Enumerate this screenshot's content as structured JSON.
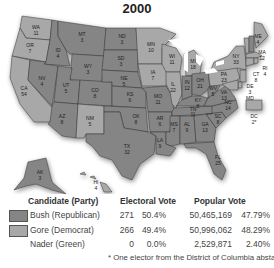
{
  "title": "2000",
  "colors": {
    "bush": "#858585",
    "gore": "#a8a8a8",
    "lake": "#ffffff",
    "text": "#333333"
  },
  "map": {
    "states": [
      {
        "abbr": "WA",
        "ev": "11",
        "winner": "gore"
      },
      {
        "abbr": "OR",
        "ev": "7",
        "winner": "gore"
      },
      {
        "abbr": "CA",
        "ev": "54",
        "winner": "gore"
      },
      {
        "abbr": "ID",
        "ev": "4",
        "winner": "bush"
      },
      {
        "abbr": "NV",
        "ev": "4",
        "winner": "bush"
      },
      {
        "abbr": "MT",
        "ev": "3",
        "winner": "bush"
      },
      {
        "abbr": "WY",
        "ev": "3",
        "winner": "bush"
      },
      {
        "abbr": "UT",
        "ev": "5",
        "winner": "bush"
      },
      {
        "abbr": "CO",
        "ev": "8",
        "winner": "bush"
      },
      {
        "abbr": "AZ",
        "ev": "8",
        "winner": "bush"
      },
      {
        "abbr": "NM",
        "ev": "5",
        "winner": "gore"
      },
      {
        "abbr": "ND",
        "ev": "3",
        "winner": "bush"
      },
      {
        "abbr": "SD",
        "ev": "3",
        "winner": "bush"
      },
      {
        "abbr": "NE",
        "ev": "5",
        "winner": "bush"
      },
      {
        "abbr": "KS",
        "ev": "6",
        "winner": "bush"
      },
      {
        "abbr": "OK",
        "ev": "8",
        "winner": "bush"
      },
      {
        "abbr": "TX",
        "ev": "32",
        "winner": "bush"
      },
      {
        "abbr": "MN",
        "ev": "10",
        "winner": "gore"
      },
      {
        "abbr": "IA",
        "ev": "7",
        "winner": "gore"
      },
      {
        "abbr": "MO",
        "ev": "11",
        "winner": "bush"
      },
      {
        "abbr": "AR",
        "ev": "6",
        "winner": "bush"
      },
      {
        "abbr": "LA",
        "ev": "9",
        "winner": "bush"
      },
      {
        "abbr": "WI",
        "ev": "11",
        "winner": "gore"
      },
      {
        "abbr": "IL",
        "ev": "22",
        "winner": "gore"
      },
      {
        "abbr": "MI",
        "ev": "18",
        "winner": "gore"
      },
      {
        "abbr": "IN",
        "ev": "12",
        "winner": "bush"
      },
      {
        "abbr": "OH",
        "ev": "21",
        "winner": "bush"
      },
      {
        "abbr": "KY",
        "ev": "8",
        "winner": "bush"
      },
      {
        "abbr": "TN",
        "ev": "11",
        "winner": "bush"
      },
      {
        "abbr": "MS",
        "ev": "7",
        "winner": "bush"
      },
      {
        "abbr": "AL",
        "ev": "9",
        "winner": "bush"
      },
      {
        "abbr": "GA",
        "ev": "13",
        "winner": "bush"
      },
      {
        "abbr": "FL",
        "ev": "25",
        "winner": "bush"
      },
      {
        "abbr": "SC",
        "ev": "8",
        "winner": "bush"
      },
      {
        "abbr": "NC",
        "ev": "14",
        "winner": "bush"
      },
      {
        "abbr": "VA",
        "ev": "13",
        "winner": "bush"
      },
      {
        "abbr": "WV",
        "ev": "5",
        "winner": "bush"
      },
      {
        "abbr": "PA",
        "ev": "23",
        "winner": "gore"
      },
      {
        "abbr": "NY",
        "ev": "33",
        "winner": "gore"
      },
      {
        "abbr": "VT",
        "ev": "3",
        "winner": "gore"
      },
      {
        "abbr": "NH",
        "ev": "4",
        "winner": "bush"
      },
      {
        "abbr": "ME",
        "ev": "4",
        "winner": "gore"
      },
      {
        "abbr": "MA",
        "ev": "12",
        "winner": "gore"
      },
      {
        "abbr": "RI",
        "ev": "4",
        "winner": "gore"
      },
      {
        "abbr": "CT",
        "ev": "8",
        "winner": "gore"
      },
      {
        "abbr": "NJ",
        "ev": "15",
        "winner": "gore"
      },
      {
        "abbr": "DE",
        "ev": "3",
        "winner": "gore"
      },
      {
        "abbr": "MD",
        "ev": "10",
        "winner": "gore"
      },
      {
        "abbr": "DC",
        "ev": "2*",
        "winner": "gore"
      },
      {
        "abbr": "AK",
        "ev": "3",
        "winner": "bush"
      },
      {
        "abbr": "HI",
        "ev": "4",
        "winner": "gore"
      }
    ]
  },
  "legend": {
    "headers": {
      "candidate": "Candidate (Party)",
      "electoral": "Electoral Vote",
      "popular": "Popular Vote"
    },
    "rows": [
      {
        "candidate": "Bush (Republican)",
        "ev": "271",
        "ev_pct": "50.4%",
        "pop": "50,465,169",
        "pop_pct": "47.79%",
        "swatch": "bush"
      },
      {
        "candidate": "Gore (Democrat)",
        "ev": "266",
        "ev_pct": "49.4%",
        "pop": "50,996,062",
        "pop_pct": "48.29%",
        "swatch": "gore"
      },
      {
        "candidate": "Nader (Green)",
        "ev": "0",
        "ev_pct": "0.0%",
        "pop": "2,529,871",
        "pop_pct": "2.40%",
        "swatch": "none"
      }
    ],
    "footnote": "* One elector from the District of Columbia abstained."
  }
}
